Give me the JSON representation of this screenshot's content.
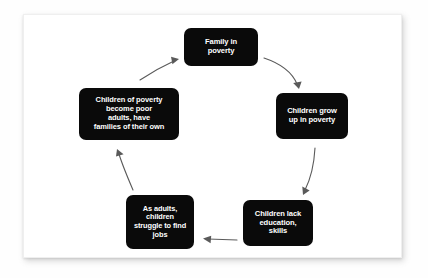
{
  "diagram": {
    "type": "cycle-flowchart",
    "direction": "clockwise",
    "card": {
      "background_color": "#ffffff",
      "border_color": "#efefef"
    },
    "node_style": {
      "fill_color": "#0a0a0a",
      "text_color": "#ffffff",
      "corner_radius_px": 7
    },
    "arrow_style": {
      "stroke_color": "#5a5a5a"
    },
    "nodes": [
      {
        "id": "family-in-poverty",
        "label": "Family in\npoverty",
        "position": "top"
      },
      {
        "id": "children-grow-up",
        "label": "Children grow\nup in poverty",
        "position": "right"
      },
      {
        "id": "children-lack-education",
        "label": "Children lack\neducation,\nskills",
        "position": "bottom-right"
      },
      {
        "id": "as-adults-struggle",
        "label": "As adults,\nchildren\nstruggle to find\njobs",
        "position": "bottom-left"
      },
      {
        "id": "children-of-poverty",
        "label": "Children of poverty\nbecome poor\nadults, have\nfamilies of their own",
        "position": "left"
      }
    ],
    "arrows": [
      {
        "id": "arrow-top-right",
        "from": "family-in-poverty",
        "to": "children-grow-up"
      },
      {
        "id": "arrow-right-down",
        "from": "children-grow-up",
        "to": "children-lack-education"
      },
      {
        "id": "arrow-bottom-left",
        "from": "children-lack-education",
        "to": "as-adults-struggle"
      },
      {
        "id": "arrow-left-up",
        "from": "as-adults-struggle",
        "to": "children-of-poverty"
      },
      {
        "id": "arrow-top-left",
        "from": "children-of-poverty",
        "to": "family-in-poverty"
      }
    ]
  }
}
